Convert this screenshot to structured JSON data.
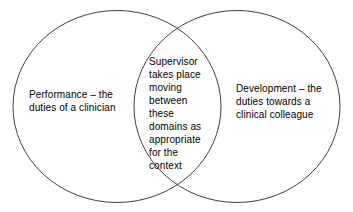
{
  "diagram": {
    "type": "venn-diagram",
    "set_count": 2,
    "background_color": "#ffffff",
    "stroke_color": "#3f3f3f",
    "text_color": "#000000",
    "left_circle": {
      "label": "Performance – the duties of a clinician",
      "lines": "Performance – the\nduties of a clinician",
      "cx": 117,
      "cy": 106,
      "rx": 104,
      "ry": 96
    },
    "right_circle": {
      "label": "Development – the duties towards a clinical colleague",
      "lines": "Development – the\nduties towards a\nclinical colleague",
      "cx": 237,
      "cy": 106,
      "rx": 103,
      "ry": 96
    },
    "intersection": {
      "label": "Supervisor takes place moving between these domains as appropriate for the context",
      "lines": "Supervisor\ntakes place\nmoving\nbetween\nthese\ndomains as\nappropriate\nfor the\ncontext"
    }
  }
}
